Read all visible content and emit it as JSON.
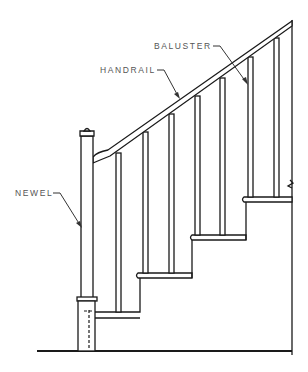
{
  "diagram": {
    "labels": {
      "baluster": "BALUSTER",
      "handrail": "HANDRAIL",
      "newel": "NEWEL"
    },
    "parts": [
      "handrail",
      "baluster",
      "newel",
      "treads",
      "floor line"
    ],
    "colors": {
      "line": "#1a1a1a",
      "label": "#555555",
      "background": "#ffffff"
    }
  }
}
